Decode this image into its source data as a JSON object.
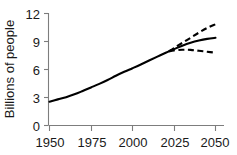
{
  "chart_data": {
    "type": "line",
    "title": "",
    "xlabel": "",
    "ylabel": "Billions of people",
    "xlim": [
      1950,
      2050
    ],
    "ylim": [
      0,
      12
    ],
    "xticks": [
      1950,
      1975,
      2000,
      2025,
      2050
    ],
    "xticklabels": [
      "1950",
      "1975",
      "2000",
      "2025",
      "2050"
    ],
    "yticks": [
      0,
      3,
      6,
      9,
      12
    ],
    "yticklabels": [
      "0",
      "3",
      "6",
      "9",
      "12"
    ],
    "grid": false,
    "legend": "none",
    "series": [
      {
        "name": "estimate-and-medium-projection",
        "style": "solid",
        "color": "#000000",
        "x": [
          1950,
          1955,
          1960,
          1965,
          1970,
          1975,
          1980,
          1985,
          1990,
          1995,
          2000,
          2005,
          2010,
          2015,
          2020,
          2022,
          2025,
          2030,
          2035,
          2040,
          2045,
          2050
        ],
        "values": [
          2.55,
          2.8,
          3.04,
          3.34,
          3.7,
          4.08,
          4.46,
          4.87,
          5.33,
          5.75,
          6.14,
          6.54,
          6.96,
          7.38,
          7.79,
          7.95,
          8.18,
          8.55,
          8.86,
          9.1,
          9.28,
          9.4
        ]
      },
      {
        "name": "high-projection",
        "style": "dashed",
        "color": "#000000",
        "x": [
          2022,
          2025,
          2030,
          2035,
          2040,
          2045,
          2050
        ],
        "values": [
          7.95,
          8.3,
          8.85,
          9.4,
          9.95,
          10.45,
          10.85
        ]
      },
      {
        "name": "low-projection",
        "style": "dashed",
        "color": "#000000",
        "x": [
          2022,
          2025,
          2030,
          2035,
          2040,
          2045,
          2050
        ],
        "values": [
          7.95,
          8.05,
          8.12,
          8.1,
          8.0,
          7.9,
          7.8
        ]
      }
    ]
  },
  "axes": {
    "ylabel": "Billions of people"
  }
}
